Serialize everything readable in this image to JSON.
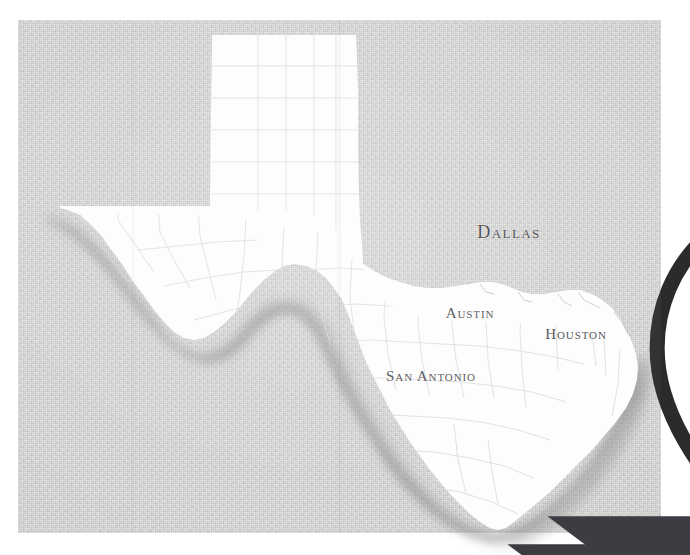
{
  "image": {
    "title": "Texas state map with Dallas location pin",
    "background_color": "#d3d3d2",
    "panel_color": "#d3d3d2",
    "state_fill": "#fdfdfd",
    "shadow_color": "#9a9a9a",
    "label_color": "#4c4c52",
    "pin_color": "#2b2b2e",
    "outer_margin_color": "#ffffff"
  },
  "map": {
    "state_name": "Texas",
    "county_lines_visible": true,
    "cities": [
      {
        "name": "Dallas",
        "marker": "location-pin",
        "label_position": "below",
        "x": 491,
        "y": 212,
        "marker_x": 489,
        "marker_y": 192
      },
      {
        "name": "Austin",
        "marker": "star",
        "label_position": "above",
        "x": 452,
        "y": 295,
        "marker_x": 452,
        "marker_y": 312
      },
      {
        "name": "Houston",
        "marker": "star",
        "label_position": "above",
        "x": 558,
        "y": 316,
        "marker_x": 561,
        "marker_y": 333
      },
      {
        "name": "San Antonio",
        "marker": "star",
        "label_position": "below",
        "x": 413,
        "y": 358,
        "marker_x": 412,
        "marker_y": 340
      }
    ]
  }
}
